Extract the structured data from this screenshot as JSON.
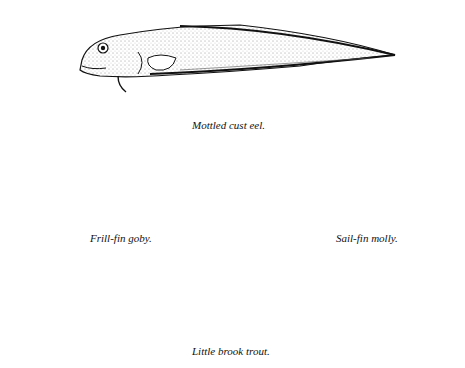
{
  "plate": {
    "figures": [
      {
        "id": "mottled-cust-eel",
        "caption": "Mottled cust eel."
      },
      {
        "id": "frill-fin-goby",
        "caption": "Frill-fin goby."
      },
      {
        "id": "sail-fin-molly",
        "caption": "Sail-fin molly."
      },
      {
        "id": "little-brook-trout",
        "caption": "Little brook trout."
      }
    ],
    "colors": {
      "ink": "#111111",
      "paper": "#ffffff"
    }
  }
}
